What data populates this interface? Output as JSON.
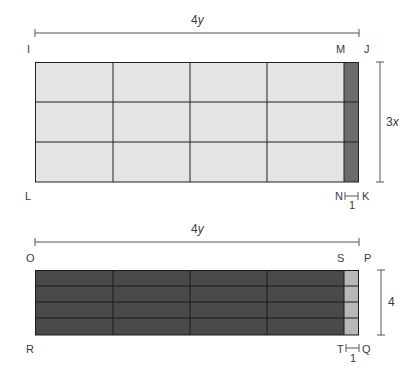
{
  "diagram": {
    "top": {
      "width_label": "4",
      "width_var": "y",
      "height_label": "3",
      "height_var": "x",
      "strip_label": "1",
      "corners": {
        "top_left": "I",
        "strip_top": "M",
        "top_right": "J",
        "bottom_left": "L",
        "strip_bottom": "N",
        "bottom_right": "K"
      },
      "grid": {
        "columns": 4,
        "rows": 3
      },
      "colors": {
        "main_fill": "#e4e4e4",
        "strip_fill": "#6b6b6b",
        "grid_line": "#222222"
      }
    },
    "bottom": {
      "width_label": "4",
      "width_var": "y",
      "height_label": "4",
      "strip_label": "1",
      "corners": {
        "top_left": "O",
        "strip_top": "S",
        "top_right": "P",
        "bottom_left": "R",
        "strip_bottom": "T",
        "bottom_right": "Q"
      },
      "grid": {
        "columns": 4,
        "rows": 4
      },
      "colors": {
        "main_fill": "#4a4a4a",
        "strip_fill": "#b8b8b8",
        "grid_line": "#1a1a1a"
      }
    }
  }
}
